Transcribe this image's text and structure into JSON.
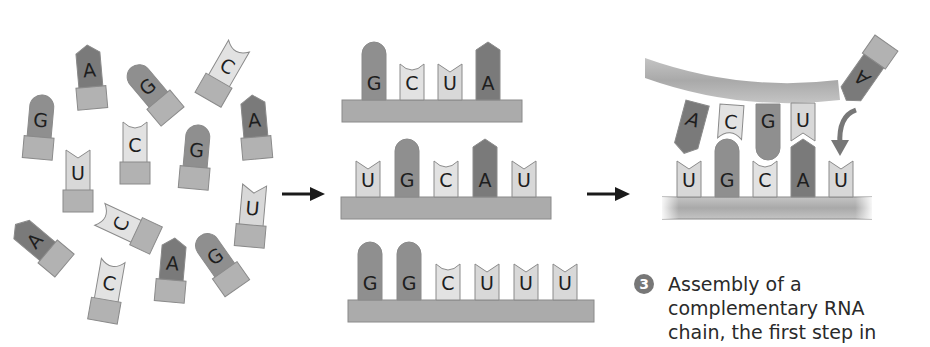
{
  "colors": {
    "G": "#8f8f8f",
    "A": "#7a7a7a",
    "C": "#e2e2e2",
    "U": "#d8d8d8",
    "tail": "#b2b2b2",
    "backbone": "#ababab",
    "arrow": "#1a1a1a",
    "text": "#2a2a2a"
  },
  "panel1": {
    "title": "Free nucleotides",
    "nucleotides": [
      {
        "base": "A",
        "x": 78,
        "y": 45,
        "rot": -5
      },
      {
        "base": "G",
        "x": 140,
        "y": 60,
        "rot": -40
      },
      {
        "base": "C",
        "x": 212,
        "y": 40,
        "rot": 30
      },
      {
        "base": "G",
        "x": 28,
        "y": 95,
        "rot": 5
      },
      {
        "base": "A",
        "x": 243,
        "y": 95,
        "rot": -5
      },
      {
        "base": "C",
        "x": 123,
        "y": 120,
        "rot": 0
      },
      {
        "base": "U",
        "x": 66,
        "y": 148,
        "rot": 0
      },
      {
        "base": "G",
        "x": 184,
        "y": 125,
        "rot": 5
      },
      {
        "base": "U",
        "x": 240,
        "y": 183,
        "rot": 5
      },
      {
        "base": "C",
        "x": 115,
        "y": 195,
        "rot": -65
      },
      {
        "base": "A",
        "x": 28,
        "y": 213,
        "rot": -50
      },
      {
        "base": "G",
        "x": 207,
        "y": 230,
        "rot": -35
      },
      {
        "base": "C",
        "x": 96,
        "y": 258,
        "rot": 10
      },
      {
        "base": "A",
        "x": 160,
        "y": 238,
        "rot": 5
      }
    ]
  },
  "panel2": {
    "strands": [
      {
        "bases": [
          "G",
          "C",
          "U",
          "A"
        ]
      },
      {
        "bases": [
          "U",
          "G",
          "C",
          "A",
          "U"
        ]
      },
      {
        "bases": [
          "G",
          "G",
          "C",
          "U",
          "U",
          "U"
        ]
      }
    ]
  },
  "panel3": {
    "template_bases": [
      "U",
      "G",
      "C",
      "A",
      "U"
    ],
    "paired_bases": [
      "A",
      "C",
      "G",
      "U"
    ],
    "incoming_base": "A"
  },
  "caption": {
    "step_number": "3",
    "lines": [
      "Assembly of a",
      "complementary RNA",
      "chain, the first step in"
    ]
  }
}
